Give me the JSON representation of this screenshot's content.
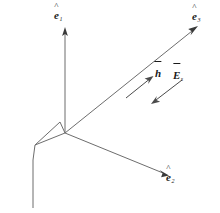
{
  "figure": {
    "background_color": "#ffffff",
    "line_color": "#6d6d6d",
    "text_color": "#1a1a1a",
    "width": 220,
    "height": 213
  },
  "axes": [
    {
      "id": "e1",
      "label_base": "e",
      "label_sub": "1",
      "accent": "hat",
      "direction": "up",
      "from": [
        65,
        133
      ],
      "to": [
        65,
        30
      ]
    },
    {
      "id": "e3",
      "label_base": "e",
      "label_sub": "3",
      "accent": "hat",
      "direction": "upper-right",
      "from": [
        65,
        133
      ],
      "to": [
        197,
        27
      ]
    },
    {
      "id": "e2",
      "label_base": "e",
      "label_sub": "2",
      "accent": "hat",
      "direction": "lower-right",
      "from": [
        65,
        133
      ],
      "to": [
        168,
        175
      ]
    }
  ],
  "field_vectors": [
    {
      "id": "h",
      "label_base": "h",
      "label_sub": "",
      "accent": "bar",
      "direction": "upper-right",
      "from": [
        126,
        98
      ],
      "to": [
        152,
        77
      ]
    },
    {
      "id": "E",
      "label_base": "E",
      "label_sub": "s",
      "accent": "bar",
      "direction": "lower-left",
      "from": [
        182,
        80
      ],
      "to": [
        152,
        103
      ]
    }
  ],
  "antenna": {
    "name": "horn-antenna",
    "triangle": [
      [
        65,
        133
      ],
      [
        35,
        145
      ],
      [
        60,
        122
      ]
    ],
    "feed_line": [
      [
        35,
        145
      ],
      [
        33,
        208
      ]
    ]
  }
}
